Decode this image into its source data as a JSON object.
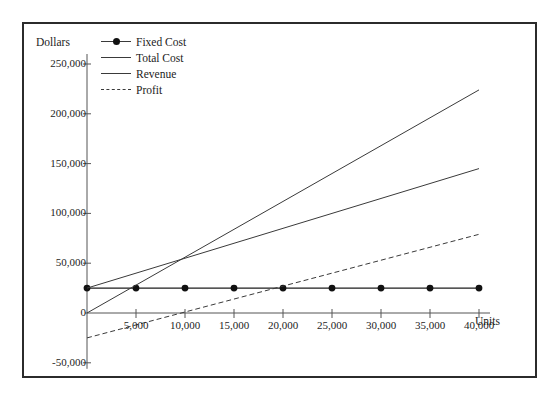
{
  "chart_data": {
    "type": "line",
    "title": "",
    "xlabel": "Units",
    "ylabel": "Dollars",
    "xlim": [
      0,
      40000
    ],
    "ylim": [
      -50000,
      250000
    ],
    "grid": false,
    "legend_position": "top-left",
    "x_ticks": [
      {
        "value": 5000,
        "label": "5,000"
      },
      {
        "value": 10000,
        "label": "10,000"
      },
      {
        "value": 15000,
        "label": "15,000"
      },
      {
        "value": 20000,
        "label": "20,000"
      },
      {
        "value": 25000,
        "label": "25,000"
      },
      {
        "value": 30000,
        "label": "30,000"
      },
      {
        "value": 35000,
        "label": "35,000"
      },
      {
        "value": 40000,
        "label": "40,000"
      }
    ],
    "y_ticks": [
      {
        "value": 250000,
        "label": "250,000"
      },
      {
        "value": 200000,
        "label": "200,000"
      },
      {
        "value": 150000,
        "label": "150,000"
      },
      {
        "value": 100000,
        "label": "100,000"
      },
      {
        "value": 50000,
        "label": "50,000"
      },
      {
        "value": 0,
        "label": "0"
      },
      {
        "value": -50000,
        "label": "-50,000"
      }
    ],
    "x": [
      0,
      5000,
      10000,
      15000,
      20000,
      25000,
      30000,
      35000,
      40000
    ],
    "series": [
      {
        "name": "Fixed Cost",
        "style": "solid-markers",
        "color": "#1c1c1c",
        "values": [
          25000,
          25000,
          25000,
          25000,
          25000,
          25000,
          25000,
          25000,
          25000
        ]
      },
      {
        "name": "Total Cost",
        "style": "solid",
        "color": "#3a3a3a",
        "values": [
          25000,
          40000,
          55000,
          70000,
          85000,
          100000,
          115000,
          130000,
          145000
        ]
      },
      {
        "name": "Revenue",
        "style": "solid",
        "color": "#3a3a3a",
        "values": [
          0,
          28000,
          56000,
          84000,
          112000,
          140000,
          168000,
          196000,
          224000
        ]
      },
      {
        "name": "Profit",
        "style": "dashed",
        "color": "#3a3a3a",
        "values": [
          -25000,
          -12000,
          1000,
          14000,
          27000,
          40000,
          53000,
          66000,
          79000
        ]
      }
    ],
    "legend": [
      {
        "label": "Fixed Cost",
        "style": "solid-markers"
      },
      {
        "label": "Total Cost",
        "style": "solid"
      },
      {
        "label": "Revenue",
        "style": "solid"
      },
      {
        "label": "Profit",
        "style": "dashed"
      }
    ]
  }
}
